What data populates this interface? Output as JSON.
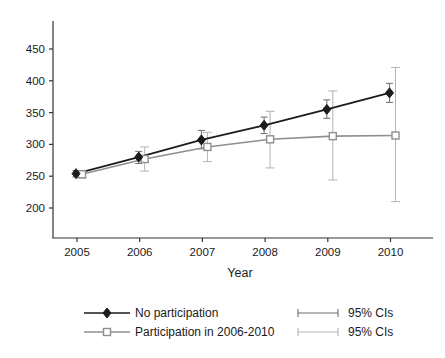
{
  "chart_data": {
    "type": "line",
    "title": "",
    "xlabel": "Year",
    "ylabel": "",
    "grid": false,
    "legend_position": "bottom",
    "background": "#ffffff",
    "axis_color": "#333333",
    "x_ticks": [
      "2005",
      "2006",
      "2007",
      "2008",
      "2009",
      "2010"
    ],
    "x_values": [
      2005,
      2006,
      2007,
      2008,
      2009,
      2010
    ],
    "y_ticks": [
      200,
      250,
      300,
      350,
      400,
      450
    ],
    "ylim": [
      155,
      500
    ],
    "series": [
      {
        "name": "No participation",
        "marker": "filled-diamond",
        "color": "#1c1c1c",
        "ci_color": "#6e6e6e",
        "ci_label": "95% CIs",
        "values": [
          254,
          280,
          307,
          330,
          355,
          381
        ],
        "ci_low": [
          249,
          270,
          293,
          317,
          341,
          366
        ],
        "ci_high": [
          259,
          289,
          322,
          343,
          370,
          396
        ]
      },
      {
        "name": "Participation in 2006-2010",
        "marker": "open-square",
        "color": "#8f8f8f",
        "ci_color": "#b3b3b3",
        "ci_label": "95% CIs",
        "values": [
          253,
          277,
          296,
          308,
          313,
          314
        ],
        "ci_low": [
          247,
          258,
          273,
          263,
          244,
          210
        ],
        "ci_high": [
          259,
          296,
          319,
          352,
          384,
          421
        ]
      }
    ]
  }
}
